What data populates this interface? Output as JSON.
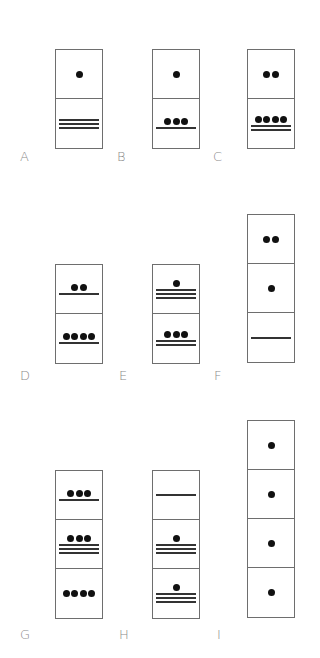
{
  "colors": {
    "border": "#6e6e6e",
    "dot": "#111111",
    "bar": "#333333",
    "label": "#8a8a8a",
    "background": "#ffffff"
  },
  "figures": [
    {
      "label": "A",
      "left": 55,
      "top": 49,
      "label_x": 20,
      "label_y": 150,
      "cells": [
        {
          "dots": 1,
          "bars": 0,
          "value": 1
        },
        {
          "dots": 0,
          "bars": 3,
          "value": 15
        }
      ]
    },
    {
      "label": "B",
      "left": 152,
      "top": 49,
      "label_x": 117,
      "label_y": 150,
      "cells": [
        {
          "dots": 1,
          "bars": 0,
          "value": 1
        },
        {
          "dots": 3,
          "bars": 1,
          "value": 8
        }
      ]
    },
    {
      "label": "C",
      "left": 247,
      "top": 49,
      "label_x": 213,
      "label_y": 150,
      "cells": [
        {
          "dots": 2,
          "bars": 0,
          "value": 2
        },
        {
          "dots": 4,
          "bars": 2,
          "value": 14
        }
      ]
    },
    {
      "label": "D",
      "left": 55,
      "top": 264,
      "label_x": 20,
      "label_y": 369,
      "cells": [
        {
          "dots": 2,
          "bars": 1,
          "value": 7
        },
        {
          "dots": 4,
          "bars": 1,
          "value": 9
        }
      ]
    },
    {
      "label": "E",
      "left": 152,
      "top": 264,
      "label_x": 119,
      "label_y": 369,
      "cells": [
        {
          "dots": 1,
          "bars": 3,
          "value": 16
        },
        {
          "dots": 3,
          "bars": 2,
          "value": 13
        }
      ]
    },
    {
      "label": "F",
      "left": 247,
      "top": 214,
      "label_x": 214,
      "label_y": 369,
      "cells": [
        {
          "dots": 2,
          "bars": 0,
          "value": 2
        },
        {
          "dots": 1,
          "bars": 0,
          "value": 1
        },
        {
          "dots": 0,
          "bars": 1,
          "value": 5
        }
      ]
    },
    {
      "label": "G",
      "left": 55,
      "top": 470,
      "label_x": 20,
      "label_y": 628,
      "cells": [
        {
          "dots": 3,
          "bars": 1,
          "value": 8
        },
        {
          "dots": 3,
          "bars": 3,
          "value": 18
        },
        {
          "dots": 4,
          "bars": 0,
          "value": 4
        }
      ]
    },
    {
      "label": "H",
      "left": 152,
      "top": 470,
      "label_x": 119,
      "label_y": 628,
      "cells": [
        {
          "dots": 0,
          "bars": 1,
          "value": 5
        },
        {
          "dots": 1,
          "bars": 3,
          "value": 16
        },
        {
          "dots": 1,
          "bars": 3,
          "value": 16
        }
      ]
    },
    {
      "label": "I",
      "left": 247,
      "top": 420,
      "label_x": 217,
      "label_y": 628,
      "cells": [
        {
          "dots": 1,
          "bars": 0,
          "value": 1
        },
        {
          "dots": 1,
          "bars": 0,
          "value": 1
        },
        {
          "dots": 1,
          "bars": 0,
          "value": 1
        },
        {
          "dots": 1,
          "bars": 0,
          "value": 1
        }
      ]
    }
  ]
}
